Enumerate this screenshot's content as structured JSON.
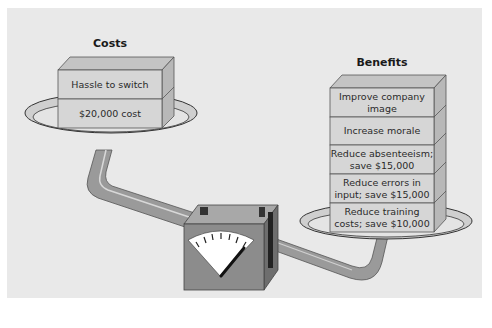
{
  "figure": {
    "costs": {
      "heading": "Costs",
      "items": [
        {
          "label": "Hassle to switch"
        },
        {
          "label": "$20,000 cost"
        }
      ]
    },
    "benefits": {
      "heading": "Benefits",
      "items": [
        {
          "label": "Improve company image"
        },
        {
          "label": "Increase morale"
        },
        {
          "label": "Reduce absenteeism; save $15,000"
        },
        {
          "label": "Reduce errors in input; save $15,000"
        },
        {
          "label": "Reduce training costs; save $10,000"
        }
      ]
    },
    "gauge": {
      "icon": "scale-gauge-icon"
    },
    "colors": {
      "panel_bg": "#e9e9e9",
      "block_face": "#d6d6d6",
      "block_top": "#c4c4c4",
      "block_side": "#b8b8b8",
      "arm": "#9a9a9a",
      "gauge_body": "#8c8c8c",
      "gauge_dial": "#ffffff"
    }
  }
}
